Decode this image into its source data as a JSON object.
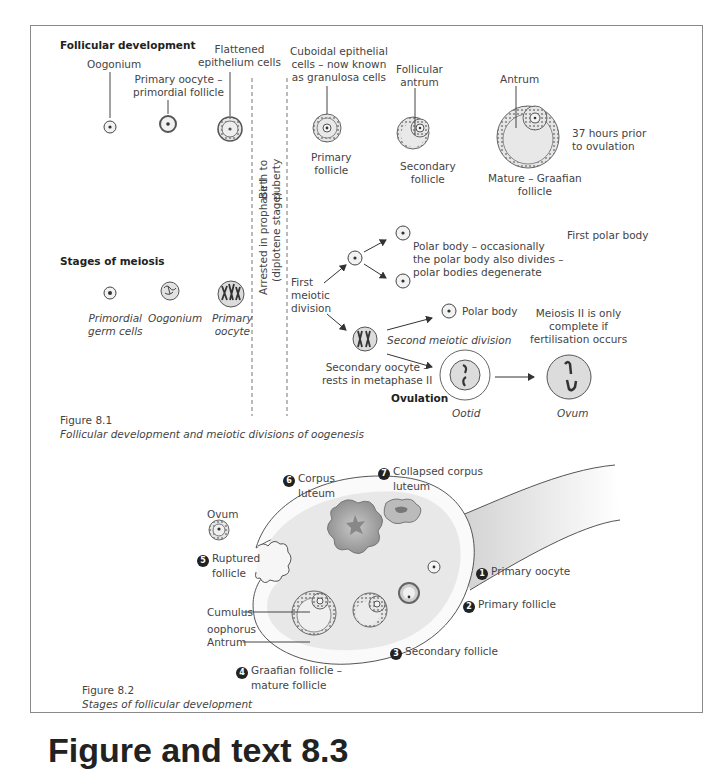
{
  "figure_8_1": {
    "section_follicular": "Follicular development",
    "section_meiosis": "Stages of meiosis",
    "follicular_labels": {
      "oogonium": "Oogonium",
      "primary_oocyte": [
        "Primary oocyte –",
        "primordial follicle"
      ],
      "flattened": [
        "Flattened",
        "epithelium cells"
      ],
      "cuboidal": [
        "Cuboidal epithelial",
        "cells – now known",
        "as granulosa cells"
      ],
      "primary_follicle": [
        "Primary",
        "follicle"
      ],
      "follicular_antrum": [
        "Follicular",
        "antrum"
      ],
      "secondary_follicle": [
        "Secondary",
        "follicle"
      ],
      "antrum": "Antrum",
      "mature": [
        "Mature – Graafian",
        "follicle"
      ],
      "timing": [
        "37 hours prior",
        "to ovulation"
      ]
    },
    "dividers": {
      "birth_to_puberty": [
        "Birth to",
        "puberty"
      ],
      "arrested": [
        "Arrested in prophase I",
        "(diplotene stage)"
      ]
    },
    "meiosis_labels": {
      "primordial_germ": [
        "Primordial",
        "germ cells"
      ],
      "oogonium": "Oogonium",
      "primary_oocyte": [
        "Primary",
        "oocyte"
      ],
      "first_meiotic": [
        "First",
        "meiotic",
        "division"
      ],
      "polar_body_note": [
        "Polar body – occasionally",
        "the polar body also divides –",
        "polar bodies degenerate"
      ],
      "first_polar_body": "First polar body",
      "polar_body": "Polar body",
      "second_meiotic": "Second meiotic division",
      "secondary_oocyte": [
        "Secondary oocyte –",
        "rests in metaphase II"
      ],
      "ovulation": "Ovulation",
      "meiosis_ii_note": [
        "Meiosis II is only",
        "complete if",
        "fertilisation occurs"
      ],
      "ootid": "Ootid",
      "ovum": "Ovum"
    },
    "caption_number": "Figure 8.1",
    "caption_text": "Follicular development and meiotic divisions of oogenesis"
  },
  "figure_8_2": {
    "labels": {
      "ovum": "Ovum",
      "corpus_luteum": {
        "num": "6",
        "text": [
          "Corpus",
          "luteum"
        ]
      },
      "collapsed_corpus_luteum": {
        "num": "7",
        "text": [
          "Collapsed corpus",
          "luteum"
        ]
      },
      "ruptured_follicle": {
        "num": "5",
        "text": [
          "Ruptured",
          "follicle"
        ]
      },
      "primary_oocyte": {
        "num": "1",
        "text": "Primary oocyte"
      },
      "primary_follicle": {
        "num": "2",
        "text": "Primary follicle"
      },
      "secondary_follicle": {
        "num": "3",
        "text": "Secondary follicle"
      },
      "graafian_follicle": {
        "num": "4",
        "text": [
          "Graafian follicle –",
          "mature follicle"
        ]
      },
      "cumulus": [
        "Cumulus",
        "oophorus"
      ],
      "antrum": "Antrum"
    },
    "caption_number": "Figure 8.2",
    "caption_text": "Stages of follicular development"
  },
  "bottom_heading": "Figure and text 8.3",
  "colors": {
    "ink": "#3a3a3a",
    "fill_light": "#eeeeee",
    "fill_mid": "#d6d6d6",
    "fill_dark": "#9a9a9a",
    "frame": "#8a8a8a"
  }
}
